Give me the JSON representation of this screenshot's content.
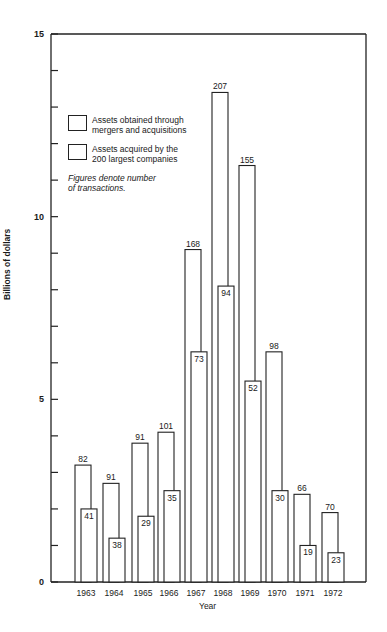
{
  "chart_data": {
    "type": "bar",
    "title": "",
    "xlabel": "Year",
    "ylabel": "Billions of dollars",
    "ylim": [
      0,
      15
    ],
    "yticks": [
      0,
      5,
      10,
      15
    ],
    "yminor_step": 1,
    "grid": false,
    "legend_position": "upper left (inside plot)",
    "categories": [
      "1963",
      "1964",
      "1965",
      "1966",
      "1967",
      "1968",
      "1969",
      "1970",
      "1971",
      "1972"
    ],
    "series": [
      {
        "name": "Assets obtained through mergers and acquisitions",
        "values": [
          3.2,
          2.7,
          3.8,
          4.1,
          9.1,
          13.4,
          11.4,
          6.3,
          2.4,
          1.9
        ],
        "labels": [
          "82",
          "91",
          "91",
          "101",
          "168",
          "207",
          "155",
          "98",
          "66",
          "70"
        ]
      },
      {
        "name": "Assets acquired by the 200 largest companies",
        "values": [
          2.0,
          1.2,
          1.8,
          2.5,
          6.3,
          8.1,
          5.5,
          2.5,
          1.0,
          0.8
        ],
        "labels": [
          "41",
          "38",
          "29",
          "35",
          "73",
          "94",
          "52",
          "30",
          "19",
          "23"
        ]
      }
    ],
    "annotations": [
      "Figures denote number of transactions."
    ]
  },
  "legend": {
    "items": [
      {
        "line1": "Assets obtained through",
        "line2": "mergers and acquisitions"
      },
      {
        "line1": "Assets acquired by the",
        "line2": "200 largest companies"
      }
    ],
    "note_line1": "Figures denote number",
    "note_line2": "of transactions."
  },
  "axes": {
    "xlabel": "Year",
    "ylabel": "Billions of dollars"
  }
}
